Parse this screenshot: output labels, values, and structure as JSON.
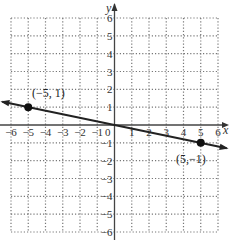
{
  "chart_data": {
    "type": "line",
    "title": "",
    "xlabel": "x",
    "ylabel": "y",
    "xlim": [
      -6,
      6
    ],
    "ylim": [
      -6,
      6
    ],
    "grid": true,
    "grid_style": "dotted",
    "x_ticks": [
      -6,
      -5,
      -4,
      -3,
      -2,
      -1,
      0,
      1,
      2,
      3,
      4,
      5,
      6
    ],
    "y_ticks": [
      -6,
      -5,
      -4,
      -3,
      -2,
      -1,
      1,
      2,
      3,
      4,
      5,
      6
    ],
    "series": [
      {
        "name": "line",
        "equation": "y = -x/5",
        "x": [
          -6.5,
          6.5
        ],
        "y": [
          1.3,
          -1.3
        ],
        "arrows": "both"
      }
    ],
    "points": [
      {
        "x": -5,
        "y": 1,
        "label": "(−5, 1)"
      },
      {
        "x": 5,
        "y": -1,
        "label": "(5,−1)"
      }
    ]
  },
  "labels": {
    "x_axis": "x",
    "y_axis": "y",
    "origin": "0",
    "point_a": "(−5, 1)",
    "point_b": "(5,−1)"
  }
}
